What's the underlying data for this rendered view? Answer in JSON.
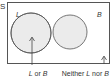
{
  "diagram": {
    "type": "venn",
    "universe_label": "S",
    "sets": [
      {
        "name": "L",
        "label": "L"
      },
      {
        "name": "B",
        "label": "B"
      }
    ],
    "shaded_region": "L or B",
    "annotations": [
      {
        "text_parts": [
          "L",
          " or ",
          "B"
        ],
        "points_to": "union"
      },
      {
        "text_parts": [
          "Neither ",
          "L",
          " nor ",
          "B"
        ],
        "points_to": "outside"
      }
    ],
    "colors": {
      "border": "#555555",
      "circle_fill": "#ebebeb",
      "text": "#333333"
    }
  }
}
